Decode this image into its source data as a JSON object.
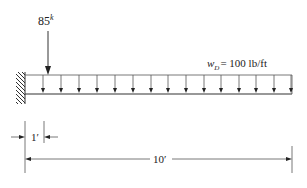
{
  "diagram": {
    "type": "cantilever-beam-loading",
    "point_load": {
      "value": "85",
      "unit_superscript": "k",
      "position_ft": 1
    },
    "distributed_load": {
      "symbol": "w",
      "subscript": "D",
      "equals_text": "= 100 lb/ft",
      "arrow_count": 15
    },
    "dimensions": {
      "short": {
        "label": "1′"
      },
      "total": {
        "label": "10′"
      }
    },
    "support": {
      "kind": "fixed-wall"
    },
    "colors": {
      "ink": "#222222",
      "background": "#ffffff"
    }
  }
}
